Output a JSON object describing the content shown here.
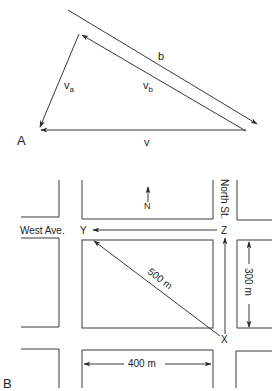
{
  "panel_a": {
    "label": "A",
    "vectors": {
      "b": "b",
      "v_a_main": "v",
      "v_a_sub": "a",
      "v_b_main": "v",
      "v_b_sub": "b",
      "v": "v"
    }
  },
  "panel_b": {
    "label": "B",
    "streets": {
      "west": "West Ave.",
      "north": "North St."
    },
    "points": {
      "x": "X",
      "y": "Y",
      "z": "Z"
    },
    "compass": "N",
    "dimensions": {
      "diagonal": "500 m",
      "height": "300 m",
      "width": "400 m"
    }
  },
  "colors": {
    "line": "#3a3a3a",
    "text": "#222222"
  }
}
